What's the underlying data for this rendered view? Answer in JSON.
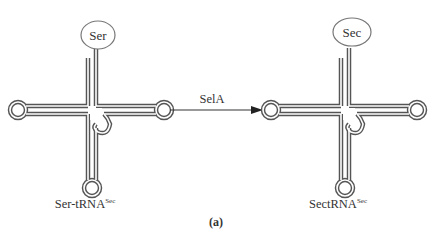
{
  "figure": {
    "panel_label": "(a)",
    "left_molecule": {
      "amino_acid": "Ser",
      "name_main": "Ser-tRNA",
      "name_superscript": "Sec"
    },
    "arrow": {
      "enzyme_label": "SelA"
    },
    "right_molecule": {
      "amino_acid": "Sec",
      "name_main": "SectRNA",
      "name_superscript": "Sec"
    },
    "colors": {
      "stroke": "#555555",
      "text": "#333333",
      "background": "#ffffff"
    }
  }
}
